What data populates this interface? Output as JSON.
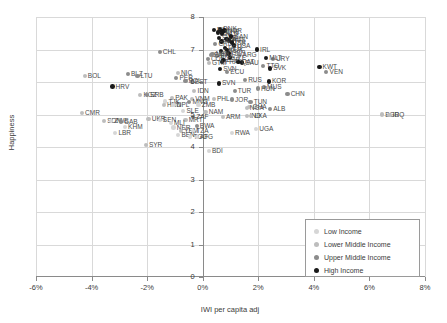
{
  "chart_data": {
    "type": "scatter",
    "title": "",
    "xlabel": "IWI per capita adj",
    "ylabel": "Happiness",
    "xlim": [
      -6,
      8
    ],
    "ylim": [
      0,
      8
    ],
    "grid": true,
    "legend_position": "bottom-right",
    "xticks": [
      "-6%",
      "-4%",
      "-2%",
      "0%",
      "2%",
      "4%",
      "6%",
      "8%"
    ],
    "xtick_values": [
      -6,
      -4,
      -2,
      0,
      2,
      4,
      6,
      8
    ],
    "yticks": [
      "0",
      "1",
      "2",
      "3",
      "4",
      "5",
      "6",
      "7",
      "8"
    ],
    "ytick_values": [
      0,
      1,
      2,
      3,
      4,
      5,
      6,
      7,
      8
    ],
    "series": [
      {
        "name": "Low Income",
        "color": "#d6d6d6",
        "marker": "circle"
      },
      {
        "name": "Lower Middle Income",
        "color": "#bdbdbd",
        "marker": "circle"
      },
      {
        "name": "Upper Middle Income",
        "color": "#8c8c8c",
        "marker": "circle"
      },
      {
        "name": "High Income",
        "color": "#1a1a1a",
        "marker": "circle"
      }
    ],
    "points": [
      {
        "label": "DNK",
        "x": 0.62,
        "y": 7.62,
        "g": 3
      },
      {
        "label": "FIN",
        "x": 0.4,
        "y": 7.6,
        "g": 3
      },
      {
        "label": "NOR",
        "x": 0.78,
        "y": 7.58,
        "g": 3
      },
      {
        "label": "ISL",
        "x": 0.55,
        "y": 7.52,
        "g": 3
      },
      {
        "label": "NLD",
        "x": 0.7,
        "y": 7.49,
        "g": 3
      },
      {
        "label": "CHE",
        "x": 0.72,
        "y": 7.55,
        "g": 3
      },
      {
        "label": "SWE",
        "x": 0.58,
        "y": 7.35,
        "g": 3
      },
      {
        "label": "NZL",
        "x": 0.85,
        "y": 7.32,
        "g": 3
      },
      {
        "label": "CAN",
        "x": 1.02,
        "y": 7.4,
        "g": 3
      },
      {
        "label": "AUS",
        "x": 0.95,
        "y": 7.28,
        "g": 3
      },
      {
        "label": "AUT",
        "x": 0.68,
        "y": 7.25,
        "g": 3
      },
      {
        "label": "ISR",
        "x": 1.05,
        "y": 7.21,
        "g": 3
      },
      {
        "label": "USA",
        "x": 1.12,
        "y": 7.12,
        "g": 3
      },
      {
        "label": "CRI",
        "x": 0.45,
        "y": 7.16,
        "g": 2
      },
      {
        "label": "DEU",
        "x": 0.8,
        "y": 7.05,
        "g": 3
      },
      {
        "label": "IRL",
        "x": 1.95,
        "y": 7.0,
        "g": 3
      },
      {
        "label": "BEL",
        "x": 0.66,
        "y": 6.95,
        "g": 3
      },
      {
        "label": "LUX",
        "x": 0.88,
        "y": 6.98,
        "g": 3
      },
      {
        "label": "GBR",
        "x": 0.92,
        "y": 6.88,
        "g": 3
      },
      {
        "label": "ARG",
        "x": 1.32,
        "y": 6.82,
        "g": 2
      },
      {
        "label": "CZE",
        "x": 0.98,
        "y": 6.75,
        "g": 3
      },
      {
        "label": "MEX",
        "x": 0.35,
        "y": 6.86,
        "g": 2
      },
      {
        "label": "BRA",
        "x": 0.52,
        "y": 6.8,
        "g": 2
      },
      {
        "label": "CHL",
        "x": -1.55,
        "y": 6.92,
        "g": 2
      },
      {
        "label": "PAN",
        "x": 0.3,
        "y": 6.82,
        "g": 2
      },
      {
        "label": "COL",
        "x": 0.18,
        "y": 6.7,
        "g": 2
      },
      {
        "label": "URY",
        "x": 2.52,
        "y": 6.72,
        "g": 2
      },
      {
        "label": "MLT",
        "x": 2.28,
        "y": 6.74,
        "g": 3
      },
      {
        "label": "ESP",
        "x": 0.75,
        "y": 6.68,
        "g": 3
      },
      {
        "label": "FRA",
        "x": 0.7,
        "y": 6.62,
        "g": 3
      },
      {
        "label": "GTM",
        "x": 0.22,
        "y": 6.58,
        "g": 1
      },
      {
        "label": "SAU",
        "x": 1.42,
        "y": 6.6,
        "g": 3
      },
      {
        "label": "QAT",
        "x": 1.28,
        "y": 6.62,
        "g": 3
      },
      {
        "label": "SVN",
        "x": 0.62,
        "y": 6.4,
        "g": 3
      },
      {
        "label": "TTO",
        "x": 2.18,
        "y": 6.48,
        "g": 2
      },
      {
        "label": "SVK",
        "x": 2.42,
        "y": 6.42,
        "g": 3
      },
      {
        "label": "KWT",
        "x": 4.2,
        "y": 6.46,
        "g": 3
      },
      {
        "label": "VEN",
        "x": 4.45,
        "y": 6.32,
        "g": 2
      },
      {
        "label": "NIC",
        "x": -0.9,
        "y": 6.28,
        "g": 1
      },
      {
        "label": "ECU",
        "x": 0.88,
        "y": 6.3,
        "g": 2
      },
      {
        "label": "BOL",
        "x": -4.25,
        "y": 6.18,
        "g": 1
      },
      {
        "label": "BLZ",
        "x": -2.7,
        "y": 6.25,
        "g": 2
      },
      {
        "label": "LTU",
        "x": -2.35,
        "y": 6.18,
        "g": 2
      },
      {
        "label": "PER",
        "x": -0.95,
        "y": 6.12,
        "g": 2
      },
      {
        "label": "POL",
        "x": -0.62,
        "y": 6.02,
        "g": 2
      },
      {
        "label": "RUS",
        "x": 1.52,
        "y": 6.05,
        "g": 2
      },
      {
        "label": "KOR",
        "x": 2.38,
        "y": 6.02,
        "g": 3
      },
      {
        "label": "EST",
        "x": -0.4,
        "y": 6.0,
        "g": 2
      },
      {
        "label": "SVN2",
        "x": 0.58,
        "y": 5.96,
        "g": 3
      },
      {
        "label": "HRV",
        "x": -3.25,
        "y": 5.86,
        "g": 3
      },
      {
        "label": "MUS",
        "x": 2.2,
        "y": 5.84,
        "g": 2
      },
      {
        "label": "HUN",
        "x": 1.98,
        "y": 5.8,
        "g": 2
      },
      {
        "label": "IDN",
        "x": -0.3,
        "y": 5.72,
        "g": 1
      },
      {
        "label": "TUR",
        "x": 1.15,
        "y": 5.72,
        "g": 2
      },
      {
        "label": "KGZ",
        "x": -2.25,
        "y": 5.6,
        "g": 1
      },
      {
        "label": "SRB",
        "x": -2.0,
        "y": 5.6,
        "g": 2
      },
      {
        "label": "CHN",
        "x": 3.05,
        "y": 5.62,
        "g": 2
      },
      {
        "label": "PAK",
        "x": -1.1,
        "y": 5.52,
        "g": 1
      },
      {
        "label": "VNM",
        "x": -0.38,
        "y": 5.48,
        "g": 1
      },
      {
        "label": "PHL",
        "x": 0.4,
        "y": 5.48,
        "g": 1
      },
      {
        "label": "JOR",
        "x": 1.05,
        "y": 5.46,
        "g": 2
      },
      {
        "label": "TJK",
        "x": -1.35,
        "y": 5.4,
        "g": 0
      },
      {
        "label": "MNG",
        "x": -0.48,
        "y": 5.38,
        "g": 2
      },
      {
        "label": "TUN",
        "x": 1.72,
        "y": 5.38,
        "g": 2
      },
      {
        "label": "HND",
        "x": -1.4,
        "y": 5.3,
        "g": 1
      },
      {
        "label": "NPL",
        "x": -1.05,
        "y": 5.28,
        "g": 0
      },
      {
        "label": "ZMB",
        "x": -0.15,
        "y": 5.28,
        "g": 0
      },
      {
        "label": "GHA",
        "x": 1.68,
        "y": 5.22,
        "g": 1
      },
      {
        "label": "NGA",
        "x": 1.58,
        "y": 5.2,
        "g": 1
      },
      {
        "label": "ALB",
        "x": 2.42,
        "y": 5.18,
        "g": 2
      },
      {
        "label": "SLE",
        "x": -0.7,
        "y": 5.1,
        "g": 0
      },
      {
        "label": "NAM",
        "x": 0.1,
        "y": 5.08,
        "g": 1
      },
      {
        "label": "CMR",
        "x": -4.35,
        "y": 5.05,
        "g": 1
      },
      {
        "label": "BGD",
        "x": 6.45,
        "y": 5.0,
        "g": 1
      },
      {
        "label": "IRQ",
        "x": 6.72,
        "y": 4.98,
        "g": 1
      },
      {
        "label": "IND",
        "x": 1.58,
        "y": 4.96,
        "g": 1
      },
      {
        "label": "LKA",
        "x": 1.75,
        "y": 4.95,
        "g": 1
      },
      {
        "label": "ZAF",
        "x": -0.35,
        "y": 4.92,
        "g": 2
      },
      {
        "label": "ARM",
        "x": 0.72,
        "y": 4.92,
        "g": 1
      },
      {
        "label": "UKR",
        "x": -1.95,
        "y": 4.86,
        "g": 1
      },
      {
        "label": "SEN",
        "x": -1.55,
        "y": 4.82,
        "g": 0
      },
      {
        "label": "MRT",
        "x": -0.62,
        "y": 4.82,
        "g": 1
      },
      {
        "label": "SDN",
        "x": -3.55,
        "y": 4.8,
        "g": 1
      },
      {
        "label": "ZWE",
        "x": -3.3,
        "y": 4.8,
        "g": 0
      },
      {
        "label": "GAB",
        "x": -2.95,
        "y": 4.78,
        "g": 2
      },
      {
        "label": "MLI",
        "x": -1.15,
        "y": 4.74,
        "g": 0
      },
      {
        "label": "BWA",
        "x": -0.22,
        "y": 4.65,
        "g": 2
      },
      {
        "label": "KHM",
        "x": -2.8,
        "y": 4.62,
        "g": 0
      },
      {
        "label": "NER",
        "x": -1.05,
        "y": 4.6,
        "g": 0
      },
      {
        "label": "UGA",
        "x": 1.92,
        "y": 4.56,
        "g": 0
      },
      {
        "label": "YEM",
        "x": -0.78,
        "y": 4.48,
        "g": 1
      },
      {
        "label": "TZA",
        "x": -0.35,
        "y": 4.48,
        "g": 0
      },
      {
        "label": "LBR",
        "x": -3.15,
        "y": 4.44,
        "g": 0
      },
      {
        "label": "RWA",
        "x": 1.05,
        "y": 4.42,
        "g": 0
      },
      {
        "label": "BEN",
        "x": -0.88,
        "y": 4.38,
        "g": 0
      },
      {
        "label": "TGO",
        "x": -0.45,
        "y": 4.32,
        "g": 0
      },
      {
        "label": "AFG",
        "x": -0.22,
        "y": 4.3,
        "g": 0
      },
      {
        "label": "SYR",
        "x": -2.05,
        "y": 4.05,
        "g": 1
      },
      {
        "label": "BDI",
        "x": 0.22,
        "y": 3.88,
        "g": 0
      }
    ]
  },
  "legend": {
    "items": [
      {
        "label": "Low Income",
        "color": "#d6d6d6"
      },
      {
        "label": "Lower Middle Income",
        "color": "#bdbdbd"
      },
      {
        "label": "Upper Middle Income",
        "color": "#8c8c8c"
      },
      {
        "label": "High Income",
        "color": "#1a1a1a"
      }
    ]
  }
}
